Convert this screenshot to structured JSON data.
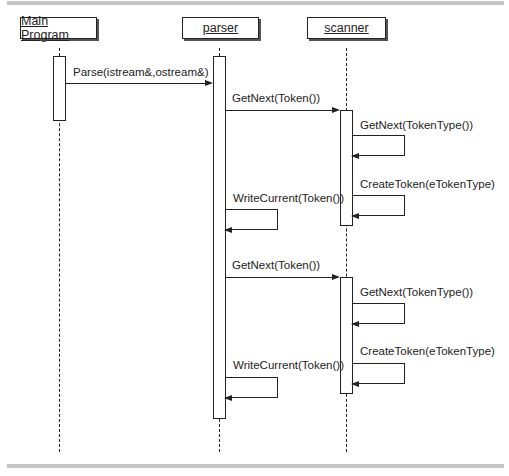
{
  "diagram": {
    "type": "sequence",
    "objects": [
      {
        "name": "Main Program"
      },
      {
        "name": "parser"
      },
      {
        "name": "scanner"
      }
    ],
    "messages": [
      {
        "from": "Main Program",
        "to": "parser",
        "label": "Parse(istream&,ostream&)"
      },
      {
        "from": "parser",
        "to": "scanner",
        "label": "GetNext(Token())"
      },
      {
        "from": "scanner",
        "to": "scanner",
        "label": "GetNext(TokenType())"
      },
      {
        "from": "scanner",
        "to": "scanner",
        "label": "CreateToken(eTokenType)"
      },
      {
        "from": "parser",
        "to": "parser",
        "label": "WriteCurrent(Token())"
      },
      {
        "from": "parser",
        "to": "scanner",
        "label": "GetNext(Token())"
      },
      {
        "from": "scanner",
        "to": "scanner",
        "label": "GetNext(TokenType())"
      },
      {
        "from": "scanner",
        "to": "scanner",
        "label": "CreateToken(eTokenType)"
      },
      {
        "from": "parser",
        "to": "parser",
        "label": "WriteCurrent(Token())"
      }
    ]
  }
}
